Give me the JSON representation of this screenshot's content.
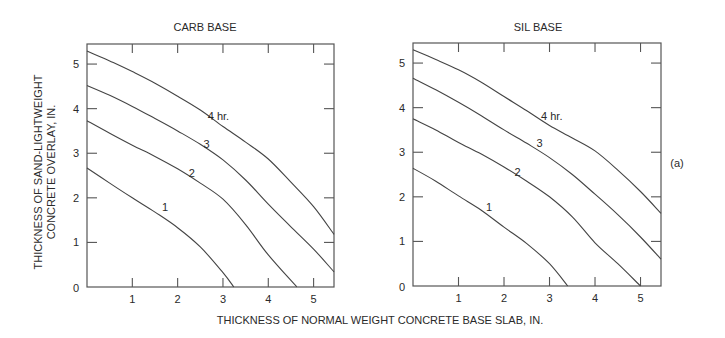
{
  "figure": {
    "x_axis_title": "THICKNESS OF NORMAL WEIGHT CONCRETE BASE SLAB, IN.",
    "y_axis_title_line1": "THICKNESS OF SAND-LIGHTWEIGHT",
    "y_axis_title_line2": "CONCRETE OVERLAY, IN.",
    "figure_label": "(a)",
    "colors": {
      "line": "#444444",
      "frame": "#555555",
      "text": "#2a2a2a",
      "background": "#ffffff"
    }
  },
  "chart_data": [
    {
      "type": "line",
      "title": "CARB BASE",
      "xlabel": "THICKNESS OF NORMAL WEIGHT CONCRETE BASE SLAB, IN.",
      "ylabel": "THICKNESS OF SAND-LIGHTWEIGHT CONCRETE OVERLAY, IN.",
      "xlim": [
        0,
        5.45
      ],
      "ylim": [
        0,
        5.45
      ],
      "x_ticks": [
        "1",
        "2",
        "3",
        "4",
        "5"
      ],
      "y_ticks": [
        "0",
        "1",
        "2",
        "3",
        "4",
        "5"
      ],
      "grid": false,
      "ticks_inward_all_sides": true,
      "series": [
        {
          "name": "1",
          "label": "1",
          "label_pos": [
            1.72,
            1.8
          ],
          "x": [
            0,
            0.5,
            1.0,
            1.5,
            2.0,
            2.5,
            3.0,
            3.24
          ],
          "y": [
            2.67,
            2.33,
            2.0,
            1.68,
            1.33,
            0.9,
            0.32,
            0
          ]
        },
        {
          "name": "2",
          "label": "2",
          "label_pos": [
            2.31,
            2.55
          ],
          "x": [
            0,
            0.5,
            1.0,
            1.5,
            2.0,
            2.5,
            3.0,
            3.5,
            4.0,
            4.63
          ],
          "y": [
            3.73,
            3.45,
            3.18,
            2.93,
            2.65,
            2.33,
            1.97,
            1.4,
            0.72,
            0
          ]
        },
        {
          "name": "3",
          "label": "3",
          "label_pos": [
            2.64,
            3.2
          ],
          "x": [
            0,
            0.5,
            1.0,
            1.5,
            2.0,
            2.5,
            3.0,
            3.5,
            4.0,
            4.5,
            5.0,
            5.45
          ],
          "y": [
            4.52,
            4.3,
            4.05,
            3.78,
            3.5,
            3.2,
            2.85,
            2.4,
            1.86,
            1.35,
            0.85,
            0.34
          ]
        },
        {
          "name": "4",
          "label": "4 hr.",
          "label_pos": [
            2.9,
            3.83
          ],
          "x": [
            0,
            0.5,
            1.0,
            1.5,
            2.0,
            2.5,
            3.0,
            3.5,
            4.0,
            4.5,
            5.0,
            5.45
          ],
          "y": [
            5.29,
            5.07,
            4.83,
            4.57,
            4.28,
            3.97,
            3.6,
            3.25,
            2.87,
            2.35,
            1.8,
            1.18
          ]
        }
      ]
    },
    {
      "type": "line",
      "title": "SIL BASE",
      "xlabel": "THICKNESS OF NORMAL WEIGHT CONCRETE BASE SLAB, IN.",
      "ylabel": "THICKNESS OF SAND-LIGHTWEIGHT CONCRETE OVERLAY, IN.",
      "xlim": [
        0,
        5.45
      ],
      "ylim": [
        0,
        5.45
      ],
      "x_ticks": [
        "1",
        "2",
        "3",
        "4",
        "5"
      ],
      "y_ticks": [
        "0",
        "1",
        "2",
        "3",
        "4",
        "5"
      ],
      "grid": false,
      "ticks_inward_all_sides": true,
      "series": [
        {
          "name": "1",
          "label": "1",
          "label_pos": [
            1.67,
            1.78
          ],
          "x": [
            0,
            0.5,
            1.0,
            1.5,
            2.0,
            2.5,
            3.0,
            3.4
          ],
          "y": [
            2.64,
            2.35,
            2.02,
            1.7,
            1.32,
            0.95,
            0.5,
            0
          ]
        },
        {
          "name": "2",
          "label": "2",
          "label_pos": [
            2.3,
            2.55
          ],
          "x": [
            0,
            0.5,
            1.0,
            1.5,
            2.0,
            2.5,
            3.0,
            3.5,
            4.0,
            4.5,
            5.0
          ],
          "y": [
            3.75,
            3.5,
            3.22,
            2.96,
            2.67,
            2.35,
            2.0,
            1.55,
            0.97,
            0.5,
            0
          ]
        },
        {
          "name": "3",
          "label": "3",
          "label_pos": [
            2.78,
            3.2
          ],
          "x": [
            0,
            0.5,
            1.0,
            1.5,
            2.0,
            2.5,
            3.0,
            3.5,
            4.0,
            4.5,
            5.0,
            5.45
          ],
          "y": [
            4.66,
            4.4,
            4.12,
            3.82,
            3.5,
            3.2,
            2.88,
            2.5,
            2.06,
            1.6,
            1.1,
            0.6
          ]
        },
        {
          "name": "4",
          "label": "4 hr.",
          "label_pos": [
            3.05,
            3.82
          ],
          "x": [
            0,
            0.5,
            1.0,
            1.5,
            2.0,
            2.5,
            3.0,
            3.5,
            4.0,
            4.5,
            5.0,
            5.45
          ],
          "y": [
            5.3,
            5.08,
            4.85,
            4.57,
            4.25,
            3.93,
            3.6,
            3.32,
            3.03,
            2.6,
            2.12,
            1.63
          ]
        }
      ]
    }
  ]
}
